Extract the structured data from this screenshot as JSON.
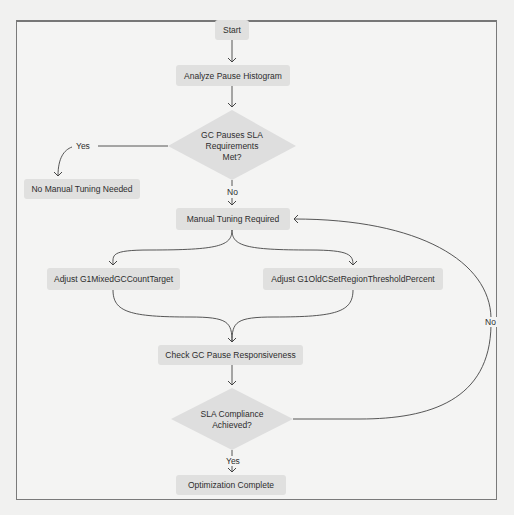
{
  "diagram": {
    "type": "flowchart",
    "nodes": {
      "start": {
        "label": "Start",
        "shape": "rounded-rect"
      },
      "analyze": {
        "label": "Analyze Pause Histogram",
        "shape": "rounded-rect"
      },
      "decision1": {
        "line1": "GC Pauses SLA",
        "line2": "Requirements",
        "line3": "Met?",
        "shape": "diamond"
      },
      "no_tuning": {
        "label": "No Manual Tuning Needed",
        "shape": "rounded-rect"
      },
      "manual_tuning": {
        "label": "Manual Tuning Required",
        "shape": "rounded-rect"
      },
      "adjust_mixed": {
        "label": "Adjust G1MixedGCCountTarget",
        "shape": "rounded-rect"
      },
      "adjust_old": {
        "label": "Adjust G1OldCSetRegionThresholdPercent",
        "shape": "rounded-rect"
      },
      "check": {
        "label": "Check GC Pause Responsiveness",
        "shape": "rounded-rect"
      },
      "decision2": {
        "line1": "SLA Compliance",
        "line2": "Achieved?",
        "shape": "diamond"
      },
      "complete": {
        "label": "Optimization Complete",
        "shape": "rounded-rect"
      }
    },
    "edge_labels": {
      "d1_yes": "Yes",
      "d1_no": "No",
      "d2_yes": "Yes",
      "d2_no": "No"
    },
    "edges": [
      {
        "from": "start",
        "to": "analyze"
      },
      {
        "from": "analyze",
        "to": "decision1"
      },
      {
        "from": "decision1",
        "to": "no_tuning",
        "label": "Yes"
      },
      {
        "from": "decision1",
        "to": "manual_tuning",
        "label": "No"
      },
      {
        "from": "manual_tuning",
        "to": "adjust_mixed"
      },
      {
        "from": "manual_tuning",
        "to": "adjust_old"
      },
      {
        "from": "adjust_mixed",
        "to": "check"
      },
      {
        "from": "adjust_old",
        "to": "check"
      },
      {
        "from": "check",
        "to": "decision2"
      },
      {
        "from": "decision2",
        "to": "complete",
        "label": "Yes"
      },
      {
        "from": "decision2",
        "to": "manual_tuning",
        "label": "No"
      }
    ],
    "colors": {
      "node_fill": "#e0e0df",
      "edge": "#444444",
      "background": "#f4f4f3",
      "frame": "#7a7a7a"
    }
  }
}
